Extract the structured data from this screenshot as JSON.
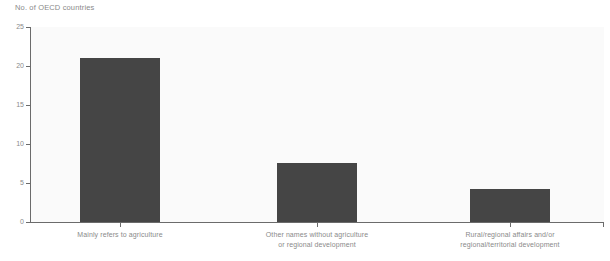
{
  "chart_data": {
    "type": "bar",
    "title": "",
    "ylabel": "No. of OECD countries",
    "xlabel": "",
    "ylim": [
      0,
      25
    ],
    "yticks": [
      0,
      5,
      10,
      15,
      20,
      25
    ],
    "ytick_labels": [
      "0",
      "5",
      "10",
      "15",
      "20",
      "25"
    ],
    "grid": false,
    "legend": false,
    "bar_color": "#454545",
    "plot_background": "#fafafa",
    "axis_color": "#6b6b6b",
    "text_color": "#8a8a8a",
    "categories": [
      "Mainly refers to agriculture",
      "Other names without agriculture or regional development",
      "Rural/regional affairs and/or regional/territorial development"
    ],
    "category_lines": [
      [
        "Mainly refers to agriculture"
      ],
      [
        "Other names without agriculture",
        "or regional development"
      ],
      [
        "Rural/regional affairs and/or",
        "regional/territorial development"
      ]
    ],
    "values": [
      21,
      7.6,
      4.2
    ]
  }
}
